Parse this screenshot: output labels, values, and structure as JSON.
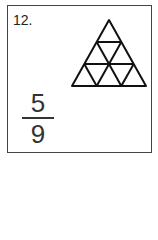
{
  "problem": {
    "number": "12.",
    "figure": {
      "shape": "triangle",
      "rows": 3,
      "total_parts": 9,
      "shaded_parts": 0
    },
    "fraction": {
      "numerator": "5",
      "denominator": "9"
    }
  }
}
